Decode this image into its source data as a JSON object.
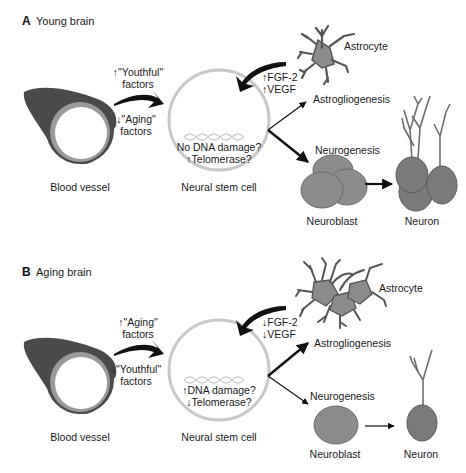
{
  "figure": {
    "panels": [
      {
        "id": "A",
        "letter": "A",
        "title": "Young brain",
        "vessel_factors_top": [
          "↑\"Youthful\"",
          "factors"
        ],
        "vessel_factors_bottom": [
          "↓\"Aging\"",
          "factors"
        ],
        "niche_factors": [
          "↑FGF-2",
          "↑VEGF"
        ],
        "stem_cell_text": [
          "No DNA damage?",
          "↑Telomerase?"
        ],
        "labels": {
          "blood_vessel": "Blood vessel",
          "neural_stem_cell": "Neural stem cell",
          "astrocyte": "Astrocyte",
          "astrogliogenesis": "Astrogliogenesis",
          "neurogenesis": "Neurogenesis",
          "neuroblast": "Neuroblast",
          "neuron": "Neuron"
        },
        "emphasis": "neurogenesis"
      },
      {
        "id": "B",
        "letter": "B",
        "title": "Aging brain",
        "vessel_factors_top": [
          "↑\"Aging\"",
          "factors"
        ],
        "vessel_factors_bottom": [
          "↓\"Youthful\"",
          "factors"
        ],
        "niche_factors": [
          "↓FGF-2",
          "↓VEGF"
        ],
        "stem_cell_text": [
          "↑DNA damage?",
          "↓Telomerase?"
        ],
        "labels": {
          "blood_vessel": "Blood vessel",
          "neural_stem_cell": "Neural stem cell",
          "astrocyte": "Astrocyte",
          "astrogliogenesis": "Astrogliogenesis",
          "neurogenesis": "Neurogenesis",
          "neuroblast": "Neuroblast",
          "neuron": "Neuron"
        },
        "emphasis": "astrogliogenesis"
      }
    ],
    "colors": {
      "vessel_dark": "#4a4a4a",
      "vessel_ring": "#9a9a9a",
      "stem_cell_ring": "#c8c8c8",
      "cell_fill": "#8c8c8c",
      "neuron_fill": "#7a7a7a",
      "dendrite": "#6e6e6e",
      "astrocyte_stroke": "#555555",
      "arrow": "#111111"
    }
  }
}
